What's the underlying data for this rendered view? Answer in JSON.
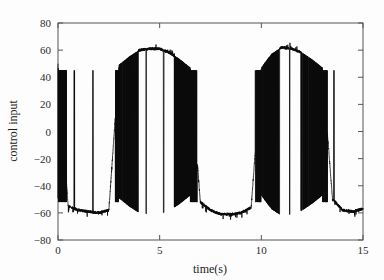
{
  "figure": {
    "background_color": "#fdfdfd",
    "axes_color": "#555555",
    "series_color": "#0a0a0a"
  },
  "chart_data": {
    "type": "line",
    "title": "",
    "subtitle": "",
    "xlabel": "time(s)",
    "ylabel": "control input",
    "xlim": [
      0,
      15
    ],
    "ylim": [
      -80,
      80
    ],
    "xticks": [
      0,
      5,
      10,
      15
    ],
    "xtick_labels": [
      "0",
      "5",
      "10",
      "15"
    ],
    "yticks": [
      80,
      60,
      40,
      20,
      0,
      -20,
      -40,
      -60,
      -80
    ],
    "ytick_labels": [
      "80",
      "60",
      "40",
      "20",
      "0",
      "−20",
      "−40",
      "−60",
      "−80"
    ],
    "grid": false,
    "legend": null,
    "legend_position": "none",
    "box": true,
    "annotations": [],
    "series": [
      {
        "name": "control input",
        "color": "#0a0a0a",
        "line_width": 0.8,
        "envelope_upper": 61,
        "envelope_lower": -60,
        "period_s": 7.0,
        "saturation_high": 62,
        "saturation_low": -61,
        "noise_amplitude": 4,
        "start_value": 50,
        "end_value": -57,
        "envelope_points": [
          {
            "t": 0.0,
            "v": 50
          },
          {
            "t": 0.5,
            "v": -55
          },
          {
            "t": 1.0,
            "v": -58
          },
          {
            "t": 1.5,
            "v": -59
          },
          {
            "t": 2.0,
            "v": -60
          },
          {
            "t": 2.5,
            "v": -58
          },
          {
            "t": 3.0,
            "v": 49
          },
          {
            "t": 3.5,
            "v": 55
          },
          {
            "t": 4.0,
            "v": 60
          },
          {
            "t": 4.5,
            "v": 61
          },
          {
            "t": 5.0,
            "v": 61
          },
          {
            "t": 5.5,
            "v": 58
          },
          {
            "t": 6.0,
            "v": 53
          },
          {
            "t": 6.5,
            "v": 47
          },
          {
            "t": 7.0,
            "v": -52
          },
          {
            "t": 7.5,
            "v": -58
          },
          {
            "t": 8.0,
            "v": -61
          },
          {
            "t": 8.5,
            "v": -61
          },
          {
            "t": 9.0,
            "v": -60
          },
          {
            "t": 9.5,
            "v": -56
          },
          {
            "t": 10.0,
            "v": 47
          },
          {
            "t": 10.5,
            "v": 57
          },
          {
            "t": 11.0,
            "v": 62
          },
          {
            "t": 11.5,
            "v": 61
          },
          {
            "t": 12.0,
            "v": 58
          },
          {
            "t": 12.5,
            "v": 53
          },
          {
            "t": 13.0,
            "v": 47
          },
          {
            "t": 13.5,
            "v": -50
          },
          {
            "t": 14.0,
            "v": -58
          },
          {
            "t": 14.5,
            "v": -59
          },
          {
            "t": 15.0,
            "v": -57
          }
        ],
        "switching_bands": [
          {
            "t_start": 0.0,
            "t_end": 0.42,
            "density": "high"
          },
          {
            "t_start": 0.62,
            "t_end": 0.66,
            "density": "low"
          },
          {
            "t_start": 0.78,
            "t_end": 0.82,
            "density": "low"
          },
          {
            "t_start": 1.7,
            "t_end": 1.74,
            "density": "low"
          },
          {
            "t_start": 2.82,
            "t_end": 3.95,
            "density": "high"
          },
          {
            "t_start": 4.3,
            "t_end": 4.34,
            "density": "low"
          },
          {
            "t_start": 5.18,
            "t_end": 5.22,
            "density": "low"
          },
          {
            "t_start": 5.72,
            "t_end": 6.85,
            "density": "high"
          },
          {
            "t_start": 9.7,
            "t_end": 10.9,
            "density": "high"
          },
          {
            "t_start": 11.35,
            "t_end": 11.4,
            "density": "low"
          },
          {
            "t_start": 11.95,
            "t_end": 13.25,
            "density": "high"
          },
          {
            "t_start": 13.55,
            "t_end": 13.6,
            "density": "low"
          }
        ]
      }
    ]
  }
}
